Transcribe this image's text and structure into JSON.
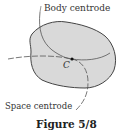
{
  "figure": {
    "caption": "Figure 5/8",
    "labels": {
      "body_centrode": "Body centrode",
      "space_centrode": "Space centrode",
      "point": "C"
    },
    "colors": {
      "body_fill": "#d9d9d9",
      "outline": "#444444",
      "curve": "#555555"
    }
  }
}
